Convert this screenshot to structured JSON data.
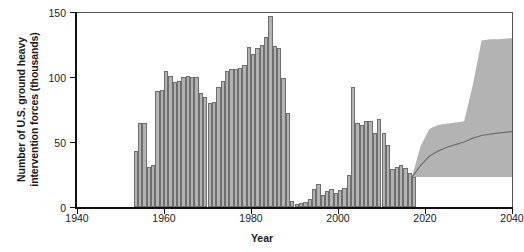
{
  "chart_data": {
    "type": "bar",
    "title": "",
    "xlabel": "Year",
    "ylabel": "Number of U.S. ground heavy intervention forces (thousands)",
    "xlim": [
      1940,
      2040
    ],
    "ylim": [
      0,
      150
    ],
    "yticks": [
      0,
      50,
      100,
      150
    ],
    "xticks": [
      1940,
      1960,
      1980,
      2000,
      2020,
      2040
    ],
    "grid": false,
    "legend": "none",
    "bar_color": "#b3b3b3",
    "bar_edge_color": "#6e6e6e",
    "band_color": "#b3b3b3",
    "median_line_color": "#6e6e6e",
    "x": [
      1953,
      1954,
      1955,
      1956,
      1957,
      1958,
      1959,
      1960,
      1961,
      1962,
      1963,
      1964,
      1965,
      1966,
      1967,
      1968,
      1969,
      1970,
      1971,
      1972,
      1973,
      1974,
      1975,
      1976,
      1977,
      1978,
      1979,
      1980,
      1981,
      1982,
      1983,
      1984,
      1985,
      1986,
      1987,
      1988,
      1989,
      1990,
      1991,
      1992,
      1993,
      1994,
      1995,
      1996,
      1997,
      1998,
      1999,
      2000,
      2001,
      2002,
      2003,
      2004,
      2005,
      2006,
      2007,
      2008,
      2009,
      2010,
      2011,
      2012,
      2013,
      2014,
      2015,
      2016,
      2017
    ],
    "values": [
      43,
      65,
      65,
      31,
      32,
      89,
      90,
      105,
      101,
      96,
      97,
      100,
      101,
      100,
      100,
      88,
      85,
      80,
      81,
      92,
      97,
      105,
      106,
      106,
      107,
      109,
      123,
      118,
      122,
      125,
      131,
      147,
      124,
      122,
      99,
      72,
      5,
      2,
      3,
      4,
      6,
      14,
      18,
      9,
      12,
      14,
      11,
      13,
      15,
      25,
      92,
      65,
      63,
      66,
      66,
      57,
      68,
      57,
      48,
      29,
      31,
      32,
      30,
      26,
      23
    ],
    "forecast": {
      "start_year": 2017,
      "end_year": 2040,
      "x": [
        2017,
        2019,
        2021,
        2023,
        2025,
        2027,
        2029,
        2031,
        2033,
        2035,
        2037,
        2040
      ],
      "lower": [
        23,
        23,
        23,
        23,
        23,
        23,
        23,
        23,
        23,
        23,
        23,
        23
      ],
      "median": [
        23,
        32,
        39,
        43,
        46,
        48,
        50,
        53,
        55,
        56,
        57,
        58
      ],
      "upper": [
        23,
        47,
        60,
        63,
        64,
        65,
        66,
        94,
        128,
        129,
        129,
        130
      ]
    },
    "annotations": []
  }
}
